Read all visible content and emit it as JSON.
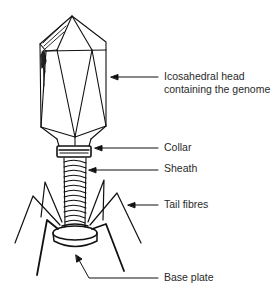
{
  "diagram": {
    "labels": [
      {
        "id": "head",
        "line1": "Icosahedral head",
        "line2": "containing the genome"
      },
      {
        "id": "collar",
        "line1": "Collar"
      },
      {
        "id": "sheath",
        "line1": "Sheath"
      },
      {
        "id": "tail_fibres",
        "line1": "Tail fibres"
      },
      {
        "id": "base_plate",
        "line1": "Base plate"
      }
    ],
    "colors": {
      "ink": "#111111",
      "text": "#2a2a2a",
      "background": "#ffffff"
    }
  }
}
